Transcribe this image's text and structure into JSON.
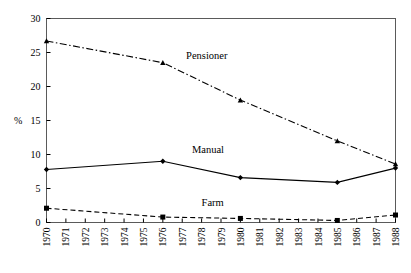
{
  "chart_data": {
    "type": "line",
    "title": "",
    "xlabel": "",
    "ylabel": "%",
    "xlim": [
      1970,
      1988
    ],
    "ylim": [
      0,
      30
    ],
    "yticks": [
      0,
      5,
      10,
      15,
      20,
      25,
      30
    ],
    "xticks": [
      1970,
      1971,
      1972,
      1973,
      1974,
      1975,
      1976,
      1977,
      1978,
      1979,
      1980,
      1981,
      1982,
      1983,
      1984,
      1985,
      1986,
      1987,
      1988
    ],
    "xtick_labels": [
      "1970",
      "1971",
      "1972",
      "1973",
      "1974",
      "1975",
      "1976",
      "1977",
      "1978",
      "1979",
      "1980",
      "1981",
      "1982",
      "1983",
      "1984",
      "1985",
      "1986",
      "1987",
      "1988"
    ],
    "ytick_labels": [
      "0",
      "5",
      "10",
      "15",
      "20",
      "25",
      "30"
    ],
    "grid": false,
    "legend": "inline-annotations",
    "xtick_label_rotation": -90,
    "series": [
      {
        "name": "Pensioner",
        "label": "Pensioner",
        "linestyle": "dashdot",
        "marker": "triangle",
        "color": "#000000",
        "x": [
          1970,
          1976,
          1980,
          1985,
          1988
        ],
        "values": [
          26.7,
          23.5,
          18.0,
          12.0,
          8.6
        ],
        "annotation": {
          "text": "Pensioner",
          "x": 1977.2,
          "y": 24.0
        }
      },
      {
        "name": "Manual",
        "label": "Manual",
        "linestyle": "solid",
        "marker": "diamond",
        "color": "#000000",
        "x": [
          1970,
          1976,
          1980,
          1985,
          1988
        ],
        "values": [
          7.8,
          9.0,
          6.6,
          5.9,
          8.0
        ],
        "annotation": {
          "text": "Manual",
          "x": 1977.5,
          "y": 10.2
        }
      },
      {
        "name": "Farm",
        "label": "Farm",
        "linestyle": "dashed",
        "marker": "square",
        "color": "#000000",
        "x": [
          1970,
          1976,
          1980,
          1985,
          1988
        ],
        "values": [
          2.1,
          0.8,
          0.6,
          0.3,
          1.1
        ],
        "annotation": {
          "text": "Farm",
          "x": 1978.0,
          "y": 2.4
        }
      }
    ]
  }
}
